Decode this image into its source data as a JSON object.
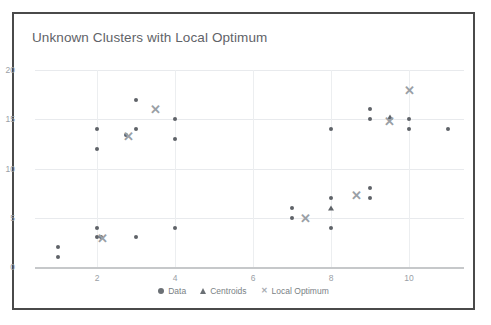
{
  "chart_data": {
    "type": "scatter",
    "title": "Unknown Clusters with Local Optimum",
    "xlabel": "",
    "ylabel": "",
    "xlim": [
      0.3,
      11.6
    ],
    "ylim": [
      0,
      20
    ],
    "xticks": [
      2,
      4,
      6,
      8,
      10
    ],
    "yticks": [
      0,
      5,
      10,
      15,
      20
    ],
    "grid": true,
    "legend_position": "bottom",
    "series": [
      {
        "name": "Data",
        "marker": "circle",
        "color": "#5f6368",
        "points": [
          [
            1,
            2
          ],
          [
            1,
            1
          ],
          [
            2,
            14
          ],
          [
            2,
            12
          ],
          [
            2,
            4
          ],
          [
            2,
            3
          ],
          [
            2.1,
            3
          ],
          [
            2.75,
            13.4
          ],
          [
            3,
            17
          ],
          [
            3,
            14
          ],
          [
            3,
            3
          ],
          [
            4,
            15
          ],
          [
            4,
            13
          ],
          [
            4,
            4
          ],
          [
            7,
            6
          ],
          [
            7,
            5
          ],
          [
            8,
            14
          ],
          [
            8,
            7
          ],
          [
            8,
            4
          ],
          [
            9,
            16
          ],
          [
            9,
            15
          ],
          [
            9,
            8
          ],
          [
            9,
            7
          ],
          [
            10,
            15
          ],
          [
            10,
            14
          ],
          [
            11,
            14
          ]
        ]
      },
      {
        "name": "Centroids",
        "marker": "triangle",
        "color": "#5f6368",
        "points": [
          [
            8,
            6
          ],
          [
            9.5,
            15.2
          ]
        ]
      },
      {
        "name": "Local Optimum",
        "marker": "x",
        "color": "#9aa0a6",
        "points": [
          [
            2.15,
            2.9
          ],
          [
            2.8,
            13.3
          ],
          [
            3.5,
            16
          ],
          [
            7.35,
            5
          ],
          [
            8.65,
            7.3
          ],
          [
            9.5,
            14.8
          ],
          [
            10,
            18
          ]
        ]
      }
    ]
  },
  "legend": {
    "items": [
      {
        "label": "Data",
        "marker": "circle-icon"
      },
      {
        "label": "Centroids",
        "marker": "triangle-icon"
      },
      {
        "label": "Local Optimum",
        "marker": "x-icon"
      }
    ]
  },
  "axis_labels": {
    "y": [
      "0",
      "5",
      "10",
      "15",
      "20"
    ],
    "x": [
      "2",
      "4",
      "6",
      "8",
      "10"
    ]
  }
}
